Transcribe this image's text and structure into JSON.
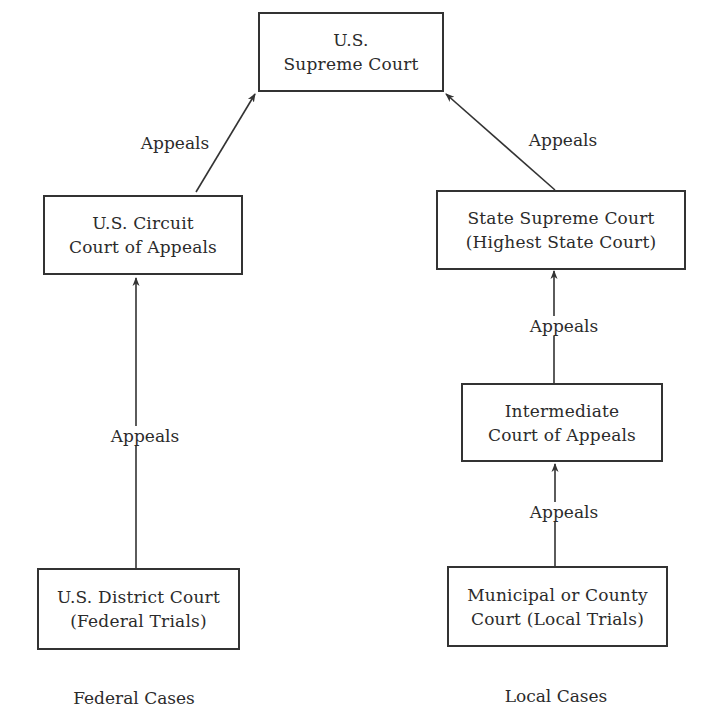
{
  "diagram": {
    "type": "flowchart",
    "colors": {
      "stroke": "#333333",
      "text": "#2b2b2b",
      "background": "#ffffff"
    },
    "nodes": {
      "supreme": {
        "line1": "U.S.",
        "line2": "Supreme Court"
      },
      "circuit": {
        "line1": "U.S. Circuit",
        "line2": "Court of Appeals"
      },
      "district": {
        "line1": "U.S. District Court",
        "line2": "(Federal Trials)"
      },
      "state_supreme": {
        "line1": "State Supreme Court",
        "line2": "(Highest State Court)"
      },
      "intermediate": {
        "line1": "Intermediate",
        "line2": "Court of Appeals"
      },
      "municipal": {
        "line1": "Municipal or County",
        "line2": "Court (Local Trials)"
      }
    },
    "edges": [
      {
        "from": "district",
        "to": "circuit",
        "label": "Appeals"
      },
      {
        "from": "circuit",
        "to": "supreme",
        "label": "Appeals"
      },
      {
        "from": "municipal",
        "to": "intermediate",
        "label": "Appeals"
      },
      {
        "from": "intermediate",
        "to": "state_supreme",
        "label": "Appeals"
      },
      {
        "from": "state_supreme",
        "to": "supreme",
        "label": "Appeals"
      }
    ],
    "columns": {
      "federal": "Federal Cases",
      "local": "Local Cases"
    }
  }
}
